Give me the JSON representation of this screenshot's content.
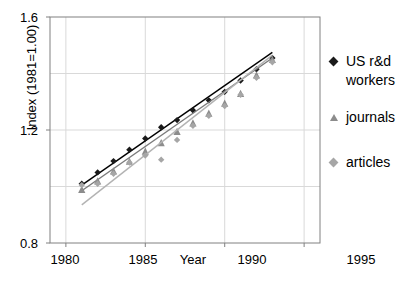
{
  "chart_data": {
    "type": "scatter",
    "title": "",
    "xlabel": "Year",
    "ylabel": "Index (1981=1.00)",
    "xlim": [
      1979,
      1996
    ],
    "ylim": [
      0.8,
      1.6
    ],
    "xticks": [
      "1980",
      "1985",
      "1990",
      "1995"
    ],
    "xtick_values": [
      1980,
      1985,
      1990,
      1995
    ],
    "yticks": [
      "0.8",
      "1.2",
      "1.6"
    ],
    "ytick_values": [
      0.8,
      1.2,
      1.6
    ],
    "gridlines_y": [
      1.0,
      1.4
    ],
    "grid": true,
    "legend_position": "right",
    "x": [
      1981,
      1982,
      1983,
      1984,
      1985,
      1986,
      1987,
      1988,
      1989,
      1990,
      1991,
      1992,
      1993
    ],
    "series": [
      {
        "name": "US r&d workers",
        "marker": "diamond",
        "color": "#1a1a1a",
        "trend_color": "#000000",
        "values": [
          1.01,
          1.05,
          1.09,
          1.13,
          1.17,
          1.21,
          1.235,
          1.27,
          1.305,
          1.335,
          1.375,
          1.415,
          1.455
        ],
        "trend_start": 1.005,
        "trend_end": 1.475
      },
      {
        "name": "journals",
        "marker": "triangle",
        "color": "#8c8c8c",
        "trend_color": "#7a7a7a",
        "values": [
          0.99,
          1.02,
          1.055,
          1.09,
          1.125,
          1.155,
          1.195,
          1.225,
          1.26,
          1.295,
          1.33,
          1.395,
          1.45
        ],
        "trend_start": 0.985,
        "trend_end": 1.455
      },
      {
        "name": "articles",
        "marker": "diamond",
        "color": "#a6a6a6",
        "trend_color": "#b3b3b3",
        "values": [
          1.005,
          1.01,
          1.045,
          1.085,
          1.11,
          1.095,
          1.165,
          1.215,
          1.25,
          1.285,
          1.325,
          1.385,
          1.44
        ],
        "trend_start": 0.935,
        "trend_end": 1.465
      }
    ]
  },
  "axis": {
    "y_title": "Index (1981=1.00)",
    "x_title": "Year",
    "y_tick_top": "1.6",
    "y_tick_mid": "1.2",
    "y_tick_bottom": "0.8",
    "x_tick_1": "1980",
    "x_tick_2": "1985",
    "x_tick_3": "1990",
    "x_tick_4": "1995"
  },
  "legend": {
    "items": [
      {
        "label_line1": "US r&d",
        "label_line2": "workers",
        "marker": "diamond-dark-icon"
      },
      {
        "label_line1": "journals",
        "label_line2": "",
        "marker": "triangle-gray-icon"
      },
      {
        "label_line1": "articles",
        "label_line2": "",
        "marker": "diamond-gray-icon"
      }
    ]
  },
  "colors": {
    "series1": "#1a1a1a",
    "series2": "#8c8c8c",
    "series3": "#a6a6a6",
    "frame": "#808080",
    "grid": "#d9d9d9"
  }
}
